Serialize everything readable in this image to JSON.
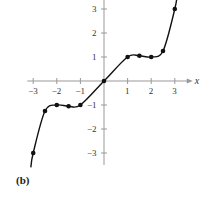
{
  "chart_data": {
    "type": "line",
    "title": "",
    "panel_label": "(b)",
    "xlabel": "x",
    "ylabel": "",
    "xlim": [
      -3.3,
      3.6
    ],
    "ylim": [
      -3.5,
      3.4
    ],
    "x_ticks": [
      -3,
      -2,
      -1,
      1,
      2,
      3
    ],
    "y_ticks": [
      -3,
      -2,
      -1,
      1,
      2,
      3
    ],
    "grid": false,
    "legend": null,
    "series": [
      {
        "name": "curve",
        "style": "smooth line with marked points",
        "points": [
          {
            "x": -3,
            "y": -3
          },
          {
            "x": -2.5,
            "y": -1.25
          },
          {
            "x": -2,
            "y": -1
          },
          {
            "x": -1.5,
            "y": -1.05
          },
          {
            "x": -1,
            "y": -1
          },
          {
            "x": 0,
            "y": 0
          },
          {
            "x": 1,
            "y": 1
          },
          {
            "x": 1.5,
            "y": 1.05
          },
          {
            "x": 2,
            "y": 1
          },
          {
            "x": 2.5,
            "y": 1.25
          },
          {
            "x": 3,
            "y": 3
          }
        ]
      }
    ],
    "colors": {
      "curve": "#111111",
      "axes": "#999999"
    }
  }
}
